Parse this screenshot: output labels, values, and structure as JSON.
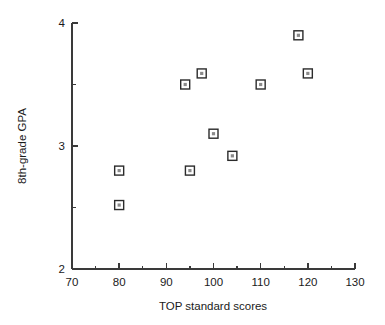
{
  "chart_data": {
    "type": "scatter",
    "title": "",
    "xlabel": "TOP standard scores",
    "ylabel": "8th-grade GPA",
    "xlim": [
      70,
      130
    ],
    "ylim": [
      2,
      4
    ],
    "grid": false,
    "legend": null,
    "x_ticks": [
      70,
      80,
      90,
      100,
      110,
      120,
      130
    ],
    "x_tick_labels": [
      "70",
      "80",
      "90",
      "100",
      "110",
      "120",
      "130"
    ],
    "x_minor_ticks": [
      75,
      85,
      95,
      105,
      115,
      125
    ],
    "y_ticks": [
      2,
      3,
      4
    ],
    "y_tick_labels": [
      "2",
      "3",
      "4"
    ],
    "y_minor_ticks": [
      2.5,
      3.5
    ],
    "marker": "open-square",
    "points": [
      {
        "x": 80,
        "y": 2.8
      },
      {
        "x": 80,
        "y": 2.52
      },
      {
        "x": 94,
        "y": 3.5
      },
      {
        "x": 95,
        "y": 2.8
      },
      {
        "x": 97.5,
        "y": 3.59
      },
      {
        "x": 100,
        "y": 3.1
      },
      {
        "x": 104,
        "y": 2.92
      },
      {
        "x": 110,
        "y": 3.5
      },
      {
        "x": 118,
        "y": 3.9
      },
      {
        "x": 120,
        "y": 3.59
      }
    ]
  },
  "colors": {
    "axis": "#3a3a3a",
    "text": "#1a1a1a",
    "marker_stroke": "#2b2b2b",
    "marker_fill": "#ffffff",
    "marker_core": "#8a8a8a",
    "background": "#ffffff"
  }
}
